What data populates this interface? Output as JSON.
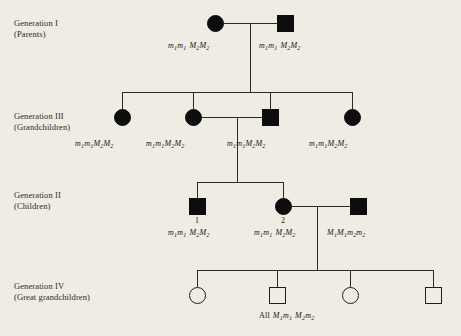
{
  "figure": {
    "type": "pedigree-chart",
    "background_color": "#efece4",
    "symbol_fill_color": "#0d0d0d",
    "line_color": "#2a2a2a"
  },
  "generations": [
    {
      "id": "generation-1",
      "roman": "Generation I",
      "relation": "(Parents)",
      "members": [
        {
          "sex": "female",
          "symbol": "circle",
          "affected": true,
          "genotype_locus1_a": "m",
          "genotype_locus1_a_sub": "1",
          "genotype_locus1_b": "m",
          "genotype_locus1_b_sub": "1",
          "genotype_locus2_a": "M",
          "genotype_locus2_a_sub": "2",
          "genotype_locus2_b": "M",
          "genotype_locus2_b_sub": "2"
        },
        {
          "sex": "male",
          "symbol": "square",
          "affected": true,
          "genotype_locus1_a": "m",
          "genotype_locus1_a_sub": "1",
          "genotype_locus1_b": "m",
          "genotype_locus1_b_sub": "1",
          "genotype_locus2_a": "M",
          "genotype_locus2_a_sub": "2",
          "genotype_locus2_b": "M",
          "genotype_locus2_b_sub": "2"
        }
      ]
    },
    {
      "id": "generation-3",
      "roman": "Generation III",
      "relation": "(Grandchildren)",
      "members": [
        {
          "sex": "female",
          "symbol": "circle",
          "affected": true,
          "genotype_locus1_a": "m",
          "genotype_locus1_a_sub": "1",
          "genotype_locus1_b": "m",
          "genotype_locus1_b_sub": "1",
          "genotype_locus2_a": "M",
          "genotype_locus2_a_sub": "2",
          "genotype_locus2_b": "M",
          "genotype_locus2_b_sub": "2"
        },
        {
          "sex": "female",
          "symbol": "circle",
          "affected": true,
          "genotype_locus1_a": "m",
          "genotype_locus1_a_sub": "1",
          "genotype_locus1_b": "m",
          "genotype_locus1_b_sub": "1",
          "genotype_locus2_a": "M",
          "genotype_locus2_a_sub": "2",
          "genotype_locus2_b": "M",
          "genotype_locus2_b_sub": "2"
        },
        {
          "sex": "male",
          "symbol": "square",
          "affected": true,
          "genotype_locus1_a": "m",
          "genotype_locus1_a_sub": "1",
          "genotype_locus1_b": "m",
          "genotype_locus1_b_sub": "1",
          "genotype_locus2_a": "M",
          "genotype_locus2_a_sub": "2",
          "genotype_locus2_b": "M",
          "genotype_locus2_b_sub": "2"
        },
        {
          "sex": "female",
          "symbol": "circle",
          "affected": true,
          "genotype_locus1_a": "m",
          "genotype_locus1_a_sub": "1",
          "genotype_locus1_b": "m",
          "genotype_locus1_b_sub": "1",
          "genotype_locus2_a": "M",
          "genotype_locus2_a_sub": "2",
          "genotype_locus2_b": "M",
          "genotype_locus2_b_sub": "2"
        }
      ]
    },
    {
      "id": "generation-2",
      "roman": "Generation II",
      "relation": "(Children)",
      "members": [
        {
          "sex": "male",
          "symbol": "square",
          "affected": true,
          "number": "1",
          "genotype_locus1_a": "m",
          "genotype_locus1_a_sub": "1",
          "genotype_locus1_b": "m",
          "genotype_locus1_b_sub": "1",
          "genotype_locus2_a": "M",
          "genotype_locus2_a_sub": "2",
          "genotype_locus2_b": "M",
          "genotype_locus2_b_sub": "2"
        },
        {
          "sex": "female",
          "symbol": "circle",
          "affected": true,
          "number": "2",
          "genotype_locus1_a": "m",
          "genotype_locus1_a_sub": "1",
          "genotype_locus1_b": "m",
          "genotype_locus1_b_sub": "1",
          "genotype_locus2_a": "M",
          "genotype_locus2_a_sub": "2",
          "genotype_locus2_b": "M",
          "genotype_locus2_b_sub": "2"
        },
        {
          "sex": "male",
          "symbol": "square",
          "affected": true,
          "genotype_locus1_a": "M",
          "genotype_locus1_a_sub": "1",
          "genotype_locus1_b": "M",
          "genotype_locus1_b_sub": "1",
          "genotype_locus2_a": "m",
          "genotype_locus2_a_sub": "2",
          "genotype_locus2_b": "m",
          "genotype_locus2_b_sub": "2"
        }
      ]
    },
    {
      "id": "generation-4",
      "roman": "Generation IV",
      "relation": "(Great grandchildren)",
      "members": [
        {
          "sex": "female",
          "symbol": "circle",
          "affected": false
        },
        {
          "sex": "male",
          "symbol": "square",
          "affected": false
        },
        {
          "sex": "female",
          "symbol": "circle",
          "affected": false
        },
        {
          "sex": "male",
          "symbol": "square",
          "affected": false
        }
      ],
      "summary_genotype": {
        "prefix": "All",
        "locus1_a": "M",
        "locus1_a_sub": "1",
        "locus1_b": "m",
        "locus1_b_sub": "1",
        "locus2_a": "M",
        "locus2_a_sub": "2",
        "locus2_b": "m",
        "locus2_b_sub": "2"
      }
    }
  ]
}
